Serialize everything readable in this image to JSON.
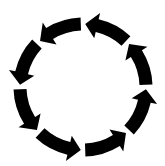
{
  "diagram": {
    "type": "cycle",
    "direction": "counter-clockwise",
    "segment_count": 8,
    "color": "#000000",
    "background": "#ffffff",
    "center": [
      83,
      87
    ],
    "radius": 63,
    "band_width": 13,
    "head_width": 26,
    "head_length_deg": 11,
    "gap_deg": 4,
    "segments": [
      {
        "id": "seg-1",
        "start_deg": 0,
        "end_deg": 45
      },
      {
        "id": "seg-2",
        "start_deg": 45,
        "end_deg": 90
      },
      {
        "id": "seg-3",
        "start_deg": 90,
        "end_deg": 135
      },
      {
        "id": "seg-4",
        "start_deg": 135,
        "end_deg": 180
      },
      {
        "id": "seg-5",
        "start_deg": 180,
        "end_deg": 225
      },
      {
        "id": "seg-6",
        "start_deg": 225,
        "end_deg": 270
      },
      {
        "id": "seg-7",
        "start_deg": 270,
        "end_deg": 315
      },
      {
        "id": "seg-8",
        "start_deg": 315,
        "end_deg": 360
      }
    ]
  }
}
